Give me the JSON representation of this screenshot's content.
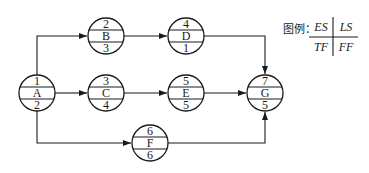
{
  "diagram": {
    "type": "single-code network diagram (activity-on-node)",
    "nodes": [
      {
        "id": "A",
        "es": "1",
        "tf": "2",
        "cx": 37,
        "cy": 93
      },
      {
        "id": "B",
        "es": "2",
        "tf": "3",
        "cx": 106,
        "cy": 36
      },
      {
        "id": "C",
        "es": "3",
        "tf": "4",
        "cx": 106,
        "cy": 93
      },
      {
        "id": "D",
        "es": "4",
        "tf": "1",
        "cx": 186,
        "cy": 36
      },
      {
        "id": "E",
        "es": "5",
        "tf": "5",
        "cx": 186,
        "cy": 93
      },
      {
        "id": "F",
        "es": "6",
        "tf": "6",
        "cx": 150,
        "cy": 143
      },
      {
        "id": "G",
        "es": "7",
        "tf": "5",
        "cx": 265,
        "cy": 93
      }
    ],
    "edges": [
      {
        "from": "A",
        "to": "B"
      },
      {
        "from": "A",
        "to": "C"
      },
      {
        "from": "A",
        "to": "F"
      },
      {
        "from": "B",
        "to": "D"
      },
      {
        "from": "C",
        "to": "E"
      },
      {
        "from": "D",
        "to": "G"
      },
      {
        "from": "E",
        "to": "G"
      },
      {
        "from": "F",
        "to": "G"
      }
    ],
    "legend": {
      "label": "图例：",
      "top_left": "ES",
      "top_right": "LS",
      "bottom_left": "TF",
      "bottom_right": "FF"
    },
    "colors": {
      "stroke": "#1a1a1a",
      "background": "#ffffff"
    }
  }
}
